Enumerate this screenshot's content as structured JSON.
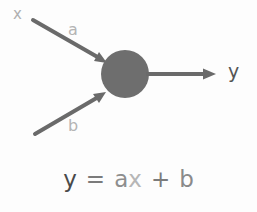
{
  "diagram": {
    "background_color": "#fdfdfd",
    "node": {
      "name": "summation-node",
      "shape": "circle",
      "cx": 125,
      "cy": 74,
      "r": 24,
      "fill": "#6e6e6e"
    },
    "edges": [
      {
        "id": "edge-a",
        "label": "a",
        "label_color": "#b4b4b4",
        "stroke": "#6a6a6a",
        "stroke_width": 4,
        "x1": 33,
        "y1": 20,
        "x2": 107,
        "y2": 63,
        "arrowhead": true
      },
      {
        "id": "edge-b",
        "label": "b",
        "label_color": "#b4b4b4",
        "stroke": "#6a6a6a",
        "stroke_width": 4,
        "x1": 35,
        "y1": 134,
        "x2": 106,
        "y2": 92,
        "arrowhead": true
      },
      {
        "id": "edge-y",
        "label": "y",
        "label_color": "#555555",
        "stroke": "#6a6a6a",
        "stroke_width": 4,
        "x1": 148,
        "y1": 74,
        "x2": 216,
        "y2": 74,
        "arrowhead": true
      }
    ],
    "input_labels": [
      {
        "id": "label-x",
        "text": "x",
        "color": "#b0b0b0"
      },
      {
        "id": "label-a",
        "text": "a",
        "color": "#b4b4b4"
      },
      {
        "id": "label-b",
        "text": "b",
        "color": "#b4b4b4"
      }
    ],
    "output_label": {
      "id": "label-y",
      "text": "y",
      "color": "#555555"
    },
    "equation": {
      "full_text": "y = ax + b",
      "tokens": [
        {
          "text": "y",
          "color": "#4a4a4a"
        },
        {
          "text": "=",
          "color": "#7b7b7b"
        },
        {
          "text": "a",
          "color": "#8e8e8e"
        },
        {
          "text": "x",
          "color": "#b6b6b6"
        },
        {
          "text": "+",
          "color": "#7b7b7b"
        },
        {
          "text": "b",
          "color": "#8a8a8a"
        }
      ]
    }
  }
}
